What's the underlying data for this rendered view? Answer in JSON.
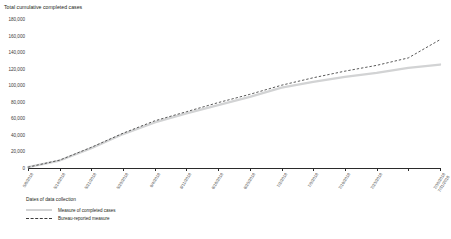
{
  "chart_data": {
    "type": "line",
    "title": "Total cumulative completed cases",
    "xlabel": "",
    "ylabel": "",
    "ylim": [
      0,
      180000
    ],
    "yticks": [
      0,
      20000,
      40000,
      60000,
      80000,
      100000,
      120000,
      140000,
      160000,
      180000
    ],
    "ytick_labels": [
      "0",
      "20,000",
      "40,000",
      "60,000",
      "80,000",
      "100,000",
      "120,000",
      "140,000",
      "160,000",
      "180,000"
    ],
    "grid": false,
    "legend_position": "below",
    "legend_title": "Dates of data collection",
    "categories": [
      "5/8/2018",
      "5/14/2018",
      "5/21/2018",
      "5/29/2018",
      "6/4/2018",
      "6/11/2018",
      "6/18/2018",
      "6/25/2018",
      "7/2/2018",
      "7/9/2018",
      "7/16/2018",
      "7/23/2018",
      "7/30/2018",
      "7/31/2018"
    ],
    "last_tick_two_line": true,
    "series": [
      {
        "name": "Measure of completed cases",
        "style": "solid",
        "color": "#d2d3d4",
        "values": [
          1000,
          9000,
          24000,
          41000,
          55000,
          66000,
          76000,
          86000,
          97000,
          104000,
          110000,
          115000,
          121000,
          125000
        ]
      },
      {
        "name": "Bureau-reported measure",
        "style": "dashed",
        "color": "#3c3c3c",
        "values": [
          1000,
          9500,
          25000,
          42000,
          57000,
          68000,
          79000,
          89000,
          100000,
          109000,
          117000,
          124000,
          133000,
          155000
        ]
      }
    ]
  }
}
